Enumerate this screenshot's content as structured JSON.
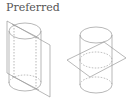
{
  "label": "Preferred",
  "colors": {
    "line": "#9a9a9a",
    "text": "#555555",
    "background": "#ffffff"
  },
  "figures": [
    {
      "name": "cylinder-with-vertical-plane"
    },
    {
      "name": "cylinder-with-horizontal-plane"
    }
  ]
}
